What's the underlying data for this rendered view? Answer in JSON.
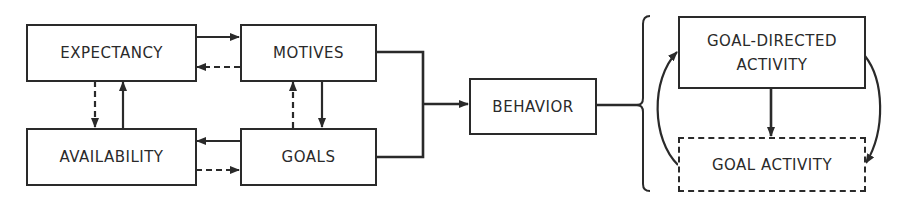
{
  "diagram": {
    "nodes": {
      "expectancy": "EXPECTANCY",
      "motives": "MOTIVES",
      "availability": "AVAILABILITY",
      "goals": "GOALS",
      "behavior": "BEHAVIOR",
      "goal_directed_activity": "GOAL-DIRECTED\nACTIVITY",
      "goal_activity": "GOAL ACTIVITY"
    },
    "edges": [
      {
        "from": "expectancy",
        "to": "motives",
        "style": "solid"
      },
      {
        "from": "motives",
        "to": "expectancy",
        "style": "dashed"
      },
      {
        "from": "expectancy",
        "to": "availability",
        "style": "dashed"
      },
      {
        "from": "availability",
        "to": "expectancy",
        "style": "solid"
      },
      {
        "from": "goals",
        "to": "motives",
        "style": "dashed"
      },
      {
        "from": "motives",
        "to": "goals",
        "style": "solid"
      },
      {
        "from": "goals",
        "to": "availability",
        "style": "solid"
      },
      {
        "from": "availability",
        "to": "goals",
        "style": "dashed"
      },
      {
        "from": "motives+goals",
        "to": "behavior",
        "style": "solid"
      },
      {
        "from": "behavior",
        "to": "goal_directed_activity|goal_activity",
        "style": "brace"
      },
      {
        "from": "goal_directed_activity",
        "to": "goal_activity",
        "style": "solid"
      },
      {
        "from": "goal_directed_activity",
        "to": "goal_activity",
        "style": "curved"
      },
      {
        "from": "goal_activity",
        "to": "goal_directed_activity",
        "style": "curved"
      }
    ]
  }
}
